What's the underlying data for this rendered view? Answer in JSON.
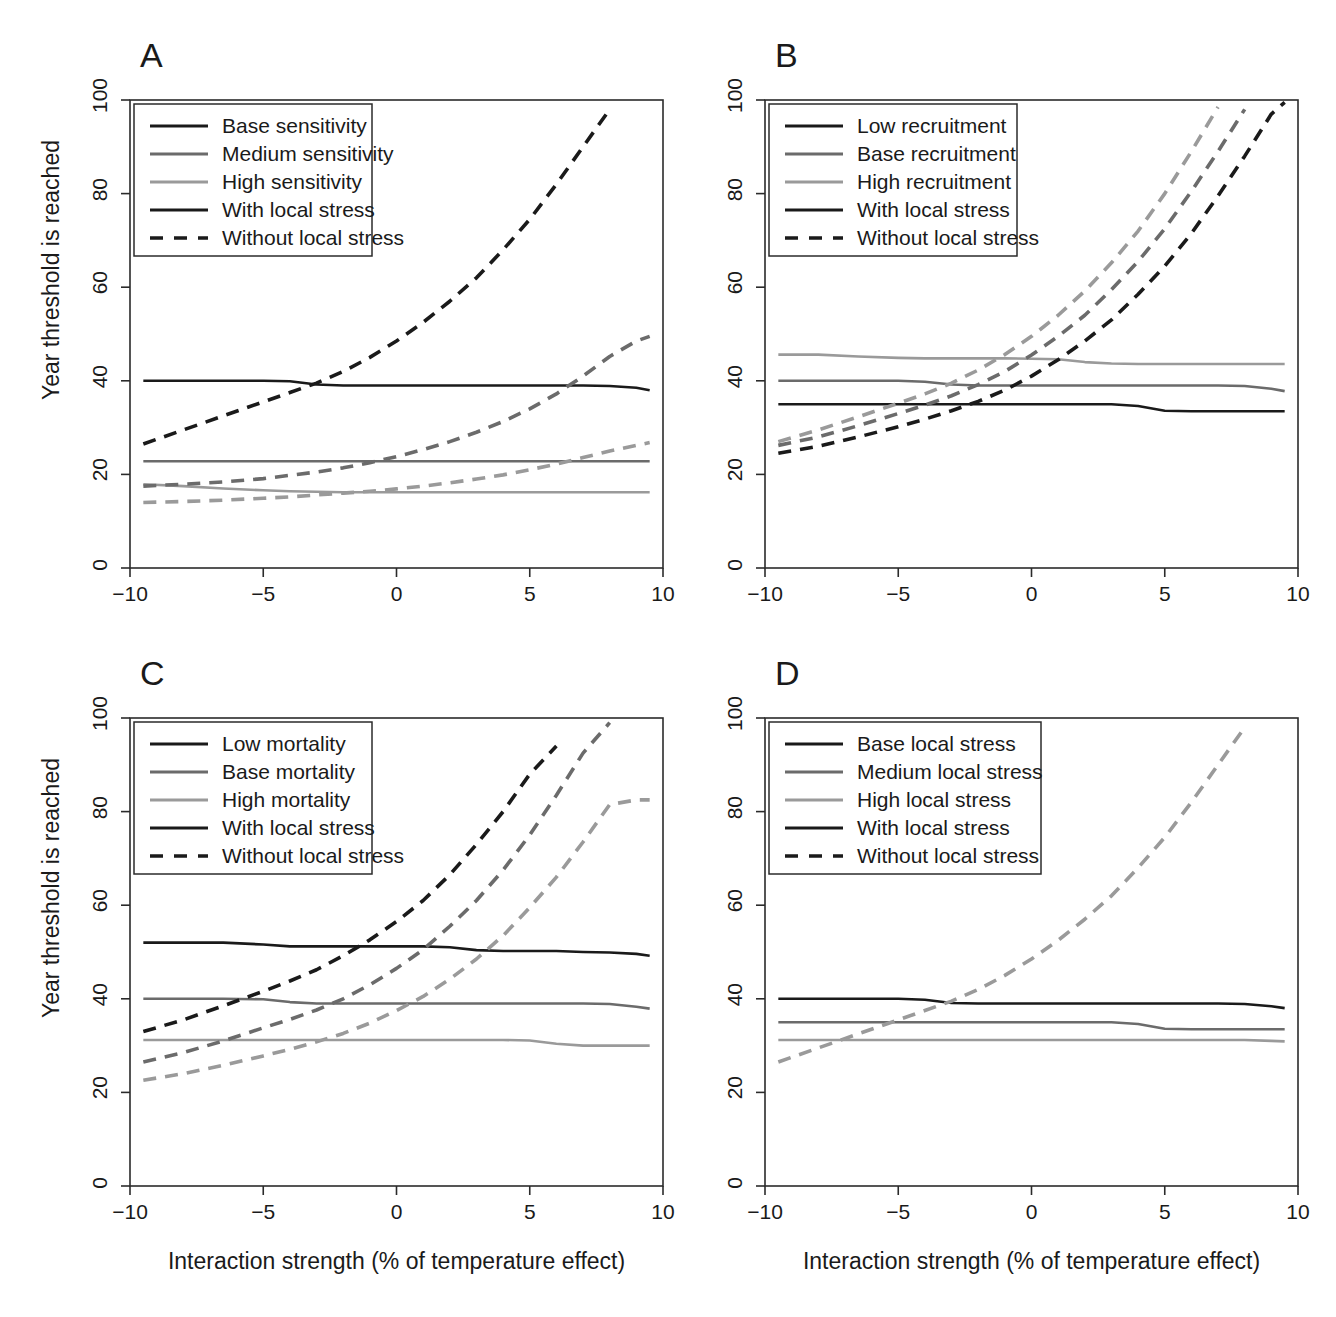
{
  "figure": {
    "axis_x_title": "Interaction strength (% of temperature effect)",
    "axis_y_title": "Year threshold is reached",
    "xticks": [
      "-10",
      "-5",
      "0",
      "5",
      "10"
    ],
    "yticks": [
      "0",
      "20",
      "40",
      "60",
      "80",
      "100"
    ],
    "panels": [
      {
        "letter": "A"
      },
      {
        "letter": "B"
      },
      {
        "letter": "C"
      },
      {
        "letter": "D"
      }
    ]
  },
  "colors": {
    "dark": "#1a1a1a",
    "medium": "#6b6b6b",
    "light": "#9a9a9a",
    "axis": "#2b2b2b",
    "background": "#ffffff"
  },
  "chart_data": [
    {
      "type": "line",
      "panel": "A",
      "title": "A",
      "xlabel": "Interaction strength (% of temperature effect)",
      "ylabel": "Year threshold is reached",
      "xlim": [
        -10,
        10
      ],
      "ylim": [
        0,
        100
      ],
      "xticks": [
        -10,
        -5,
        0,
        5,
        10
      ],
      "yticks": [
        0,
        20,
        40,
        60,
        80,
        100
      ],
      "grid": false,
      "legend_position": "top-left",
      "legend": [
        {
          "label": "Base sensitivity",
          "color": "#1a1a1a",
          "style": "solid"
        },
        {
          "label": "Medium sensitivity",
          "color": "#6b6b6b",
          "style": "solid"
        },
        {
          "label": "High sensitivity",
          "color": "#9a9a9a",
          "style": "solid"
        },
        {
          "label": "With local stress",
          "color": "#1a1a1a",
          "style": "solid"
        },
        {
          "label": "Without local stress",
          "color": "#1a1a1a",
          "style": "dashed"
        }
      ],
      "x": [
        -9.5,
        -8,
        -6.5,
        -5,
        -4,
        -3,
        -2,
        -1,
        0,
        1,
        2,
        3,
        4,
        5,
        6,
        7,
        8,
        9,
        9.5
      ],
      "series": [
        {
          "name": "Base sensitivity - with local stress",
          "color": "#1a1a1a",
          "style": "solid",
          "values": [
            40.0,
            40.0,
            40.0,
            40.0,
            39.9,
            39.2,
            39.0,
            39.0,
            39.0,
            39.0,
            39.0,
            39.0,
            39.0,
            39.0,
            39.0,
            39.0,
            38.9,
            38.5,
            38.0
          ]
        },
        {
          "name": "Medium sensitivity - with local stress",
          "color": "#6b6b6b",
          "style": "solid",
          "values": [
            22.8,
            22.8,
            22.8,
            22.8,
            22.8,
            22.8,
            22.8,
            22.8,
            22.8,
            22.8,
            22.8,
            22.8,
            22.8,
            22.8,
            22.8,
            22.8,
            22.8,
            22.8,
            22.8
          ]
        },
        {
          "name": "High sensitivity - with local stress",
          "color": "#9a9a9a",
          "style": "solid",
          "values": [
            17.9,
            17.5,
            17.0,
            16.6,
            16.4,
            16.3,
            16.2,
            16.2,
            16.2,
            16.2,
            16.2,
            16.2,
            16.2,
            16.2,
            16.2,
            16.2,
            16.2,
            16.2,
            16.2
          ]
        },
        {
          "name": "Base sensitivity - without local stress",
          "color": "#1a1a1a",
          "style": "dashed",
          "values": [
            26.5,
            29.5,
            32.5,
            35.5,
            37.5,
            39.5,
            42.0,
            45.0,
            48.5,
            52.5,
            57.0,
            62.0,
            68.0,
            74.5,
            82.0,
            90.0,
            98.0,
            null,
            null
          ]
        },
        {
          "name": "Medium sensitivity - without local stress",
          "color": "#6b6b6b",
          "style": "dashed",
          "values": [
            17.5,
            17.9,
            18.4,
            19.1,
            19.8,
            20.5,
            21.4,
            22.5,
            23.8,
            25.3,
            27.0,
            29.0,
            31.3,
            34.0,
            37.2,
            41.0,
            45.2,
            48.5,
            49.5
          ]
        },
        {
          "name": "High sensitivity - without local stress",
          "color": "#9a9a9a",
          "style": "dashed",
          "values": [
            14.0,
            14.2,
            14.5,
            14.9,
            15.2,
            15.6,
            16.0,
            16.4,
            16.9,
            17.5,
            18.2,
            19.0,
            19.9,
            21.0,
            22.2,
            23.6,
            25.0,
            26.2,
            26.8
          ]
        }
      ]
    },
    {
      "type": "line",
      "panel": "B",
      "title": "B",
      "xlabel": "Interaction strength (% of temperature effect)",
      "ylabel": "Year threshold is reached",
      "xlim": [
        -10,
        10
      ],
      "ylim": [
        0,
        100
      ],
      "xticks": [
        -10,
        -5,
        0,
        5,
        10
      ],
      "yticks": [
        0,
        20,
        40,
        60,
        80,
        100
      ],
      "grid": false,
      "legend_position": "top-left",
      "legend": [
        {
          "label": "Low recruitment",
          "color": "#1a1a1a",
          "style": "solid"
        },
        {
          "label": "Base recruitment",
          "color": "#6b6b6b",
          "style": "solid"
        },
        {
          "label": "High recruitment",
          "color": "#9a9a9a",
          "style": "solid"
        },
        {
          "label": "With local stress",
          "color": "#1a1a1a",
          "style": "solid"
        },
        {
          "label": "Without local stress",
          "color": "#1a1a1a",
          "style": "dashed"
        }
      ],
      "x": [
        -9.5,
        -8,
        -6.5,
        -5,
        -4,
        -3,
        -2,
        -1,
        0,
        1,
        2,
        3,
        4,
        5,
        6,
        7,
        8,
        9,
        9.5
      ],
      "series": [
        {
          "name": "Low recruitment - with local stress",
          "color": "#1a1a1a",
          "style": "solid",
          "values": [
            35.0,
            35.0,
            35.0,
            35.0,
            35.0,
            35.0,
            35.0,
            35.0,
            35.0,
            35.0,
            35.0,
            35.0,
            34.6,
            33.6,
            33.5,
            33.5,
            33.5,
            33.5,
            33.5
          ]
        },
        {
          "name": "Base recruitment - with local stress",
          "color": "#6b6b6b",
          "style": "solid",
          "values": [
            40.0,
            40.0,
            40.0,
            40.0,
            39.8,
            39.2,
            39.0,
            39.0,
            39.0,
            39.0,
            39.0,
            39.0,
            39.0,
            39.0,
            39.0,
            39.0,
            38.9,
            38.3,
            37.8
          ]
        },
        {
          "name": "High recruitment - with local stress",
          "color": "#9a9a9a",
          "style": "solid",
          "values": [
            45.6,
            45.6,
            45.2,
            44.9,
            44.8,
            44.8,
            44.8,
            44.8,
            44.7,
            44.6,
            44.0,
            43.7,
            43.6,
            43.6,
            43.6,
            43.6,
            43.6,
            43.6,
            43.6
          ]
        },
        {
          "name": "Low recruitment - without local stress",
          "color": "#1a1a1a",
          "style": "dashed",
          "values": [
            24.5,
            26.0,
            28.0,
            30.2,
            31.8,
            33.6,
            35.6,
            38.0,
            41.0,
            44.5,
            48.5,
            53.0,
            58.5,
            64.5,
            71.5,
            79.5,
            88.0,
            97.0,
            99.5
          ]
        },
        {
          "name": "Base recruitment - without local stress",
          "color": "#6b6b6b",
          "style": "dashed",
          "values": [
            26.2,
            28.0,
            30.4,
            33.0,
            34.8,
            36.8,
            39.2,
            42.0,
            45.5,
            49.5,
            54.0,
            59.5,
            65.5,
            72.5,
            80.5,
            89.0,
            98.0,
            null,
            null
          ]
        },
        {
          "name": "High recruitment - without local stress",
          "color": "#9a9a9a",
          "style": "dashed",
          "values": [
            27.0,
            29.5,
            32.3,
            35.2,
            37.2,
            39.5,
            42.3,
            45.6,
            49.5,
            54.0,
            59.2,
            65.2,
            72.0,
            80.0,
            89.0,
            98.5,
            null,
            null,
            null
          ]
        }
      ]
    },
    {
      "type": "line",
      "panel": "C",
      "title": "C",
      "xlabel": "Interaction strength (% of temperature effect)",
      "ylabel": "Year threshold is reached",
      "xlim": [
        -10,
        10
      ],
      "ylim": [
        0,
        100
      ],
      "xticks": [
        -10,
        -5,
        0,
        5,
        10
      ],
      "yticks": [
        0,
        20,
        40,
        60,
        80,
        100
      ],
      "grid": false,
      "legend_position": "top-left",
      "legend": [
        {
          "label": "Low mortality",
          "color": "#1a1a1a",
          "style": "solid"
        },
        {
          "label": "Base mortality",
          "color": "#6b6b6b",
          "style": "solid"
        },
        {
          "label": "High mortality",
          "color": "#9a9a9a",
          "style": "solid"
        },
        {
          "label": "With local stress",
          "color": "#1a1a1a",
          "style": "solid"
        },
        {
          "label": "Without local stress",
          "color": "#1a1a1a",
          "style": "dashed"
        }
      ],
      "x": [
        -9.5,
        -8,
        -6.5,
        -5,
        -4,
        -3,
        -2,
        -1,
        0,
        1,
        2,
        3,
        4,
        5,
        6,
        7,
        8,
        9,
        9.5
      ],
      "series": [
        {
          "name": "Low mortality - with local stress",
          "color": "#1a1a1a",
          "style": "solid",
          "values": [
            52.0,
            52.0,
            52.0,
            51.6,
            51.2,
            51.2,
            51.2,
            51.2,
            51.2,
            51.2,
            51.0,
            50.4,
            50.2,
            50.2,
            50.2,
            50.0,
            49.9,
            49.6,
            49.2
          ]
        },
        {
          "name": "Base mortality - with local stress",
          "color": "#6b6b6b",
          "style": "solid",
          "values": [
            40.0,
            40.0,
            40.0,
            39.9,
            39.3,
            39.0,
            39.0,
            39.0,
            39.0,
            39.0,
            39.0,
            39.0,
            39.0,
            39.0,
            39.0,
            39.0,
            38.9,
            38.3,
            37.9
          ]
        },
        {
          "name": "High mortality - with local stress",
          "color": "#9a9a9a",
          "style": "solid",
          "values": [
            31.2,
            31.2,
            31.2,
            31.2,
            31.2,
            31.2,
            31.2,
            31.2,
            31.2,
            31.2,
            31.2,
            31.2,
            31.2,
            31.1,
            30.4,
            30.0,
            30.0,
            30.0,
            30.0
          ]
        },
        {
          "name": "Low mortality - without local stress",
          "color": "#1a1a1a",
          "style": "dashed",
          "values": [
            33.0,
            35.5,
            38.5,
            41.6,
            43.8,
            46.2,
            49.2,
            52.6,
            56.5,
            61.0,
            66.5,
            73.0,
            80.0,
            88.0,
            94.0,
            null,
            null,
            null,
            null
          ]
        },
        {
          "name": "Base mortality - without local stress",
          "color": "#6b6b6b",
          "style": "dashed",
          "values": [
            26.5,
            28.5,
            31.0,
            33.8,
            35.6,
            37.6,
            40.0,
            43.0,
            46.5,
            50.5,
            55.5,
            61.0,
            67.5,
            75.0,
            83.5,
            92.5,
            99.0,
            null,
            null
          ]
        },
        {
          "name": "High mortality - without local stress",
          "color": "#9a9a9a",
          "style": "dashed",
          "values": [
            22.6,
            24.0,
            25.8,
            27.8,
            29.2,
            30.8,
            32.6,
            34.8,
            37.5,
            40.5,
            44.2,
            48.5,
            53.5,
            59.5,
            66.0,
            73.5,
            81.5,
            82.5,
            82.5
          ]
        }
      ]
    },
    {
      "type": "line",
      "panel": "D",
      "title": "D",
      "xlabel": "Interaction strength (% of temperature effect)",
      "ylabel": "Year threshold is reached",
      "xlim": [
        -10,
        10
      ],
      "ylim": [
        0,
        100
      ],
      "xticks": [
        -10,
        -5,
        0,
        5,
        10
      ],
      "yticks": [
        0,
        20,
        40,
        60,
        80,
        100
      ],
      "grid": false,
      "legend_position": "top-left",
      "legend": [
        {
          "label": "Base local stress",
          "color": "#1a1a1a",
          "style": "solid"
        },
        {
          "label": "Medium local stress",
          "color": "#6b6b6b",
          "style": "solid"
        },
        {
          "label": "High local stress",
          "color": "#9a9a9a",
          "style": "solid"
        },
        {
          "label": "With local stress",
          "color": "#1a1a1a",
          "style": "solid"
        },
        {
          "label": "Without local stress",
          "color": "#1a1a1a",
          "style": "dashed"
        }
      ],
      "x": [
        -9.5,
        -8,
        -6.5,
        -5,
        -4,
        -3,
        -2,
        -1,
        0,
        1,
        2,
        3,
        4,
        5,
        6,
        7,
        8,
        9,
        9.5
      ],
      "series": [
        {
          "name": "Base local stress - with local stress",
          "color": "#1a1a1a",
          "style": "solid",
          "values": [
            40.0,
            40.0,
            40.0,
            40.0,
            39.8,
            39.1,
            39.0,
            39.0,
            39.0,
            39.0,
            39.0,
            39.0,
            39.0,
            39.0,
            39.0,
            39.0,
            38.9,
            38.4,
            38.0
          ]
        },
        {
          "name": "Medium local stress - with local stress",
          "color": "#6b6b6b",
          "style": "solid",
          "values": [
            35.0,
            35.0,
            35.0,
            35.0,
            35.0,
            35.0,
            35.0,
            35.0,
            35.0,
            35.0,
            35.0,
            35.0,
            34.6,
            33.6,
            33.5,
            33.5,
            33.5,
            33.5,
            33.5
          ]
        },
        {
          "name": "High local stress - with local stress",
          "color": "#9a9a9a",
          "style": "solid",
          "values": [
            31.2,
            31.2,
            31.2,
            31.2,
            31.2,
            31.2,
            31.2,
            31.2,
            31.2,
            31.2,
            31.2,
            31.2,
            31.2,
            31.2,
            31.2,
            31.2,
            31.2,
            31.0,
            30.9
          ]
        },
        {
          "name": "Without local stress",
          "color": "#9a9a9a",
          "style": "dashed",
          "values": [
            26.5,
            29.5,
            32.5,
            35.5,
            37.5,
            39.5,
            42.0,
            45.0,
            48.5,
            52.5,
            57.0,
            62.0,
            68.0,
            74.5,
            82.0,
            90.0,
            98.0,
            null,
            null
          ]
        }
      ]
    }
  ]
}
